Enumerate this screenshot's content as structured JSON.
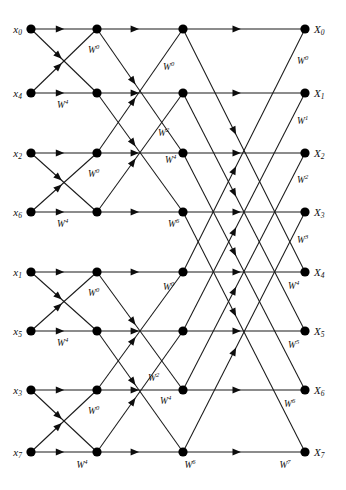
{
  "figure": {
    "type": "fft-butterfly-signal-flow-graph",
    "background_color": "#ffffff",
    "line_color": "#1a1a1a",
    "node_color": "#000000",
    "stages": 3,
    "points": 8
  },
  "geometry": {
    "width": 346,
    "height": 490,
    "column_x": [
      31,
      97,
      183,
      305
    ],
    "row_y": [
      29,
      93,
      153,
      212,
      272,
      331,
      390,
      452
    ],
    "node_radius": 4.6
  },
  "inputs": [
    {
      "symbol": "x",
      "index": "0",
      "row": 0
    },
    {
      "symbol": "x",
      "index": "4",
      "row": 1
    },
    {
      "symbol": "x",
      "index": "2",
      "row": 2
    },
    {
      "symbol": "x",
      "index": "6",
      "row": 3
    },
    {
      "symbol": "x",
      "index": "1",
      "row": 4
    },
    {
      "symbol": "x",
      "index": "5",
      "row": 5
    },
    {
      "symbol": "x",
      "index": "3",
      "row": 6
    },
    {
      "symbol": "x",
      "index": "7",
      "row": 7
    }
  ],
  "outputs": [
    {
      "symbol": "X",
      "index": "0",
      "row": 0
    },
    {
      "symbol": "X",
      "index": "1",
      "row": 1
    },
    {
      "symbol": "X",
      "index": "2",
      "row": 2
    },
    {
      "symbol": "X",
      "index": "3",
      "row": 3
    },
    {
      "symbol": "X",
      "index": "4",
      "row": 4
    },
    {
      "symbol": "X",
      "index": "5",
      "row": 5
    },
    {
      "symbol": "X",
      "index": "6",
      "row": 6
    },
    {
      "symbol": "X",
      "index": "7",
      "row": 7
    }
  ],
  "twiddle_labels": [
    {
      "stage": 1,
      "base": "W",
      "exponent": "0",
      "x": 88,
      "y": 53,
      "anchor": "start"
    },
    {
      "stage": 1,
      "base": "W",
      "exponent": "4",
      "x": 57,
      "y": 108,
      "anchor": "start"
    },
    {
      "stage": 1,
      "base": "W",
      "exponent": "0",
      "x": 88,
      "y": 177,
      "anchor": "start"
    },
    {
      "stage": 1,
      "base": "W",
      "exponent": "4",
      "x": 57,
      "y": 227,
      "anchor": "start"
    },
    {
      "stage": 1,
      "base": "W",
      "exponent": "0",
      "x": 88,
      "y": 296,
      "anchor": "start"
    },
    {
      "stage": 1,
      "base": "W",
      "exponent": "4",
      "x": 57,
      "y": 346,
      "anchor": "start"
    },
    {
      "stage": 1,
      "base": "W",
      "exponent": "0",
      "x": 88,
      "y": 414,
      "anchor": "start"
    },
    {
      "stage": 1,
      "base": "W",
      "exponent": "4",
      "x": 82,
      "y": 468,
      "anchor": "middle"
    },
    {
      "stage": 2,
      "base": "W",
      "exponent": "0",
      "x": 163,
      "y": 70,
      "anchor": "start"
    },
    {
      "stage": 2,
      "base": "W",
      "exponent": "2",
      "x": 158,
      "y": 136,
      "anchor": "start"
    },
    {
      "stage": 2,
      "base": "W",
      "exponent": "4",
      "x": 165,
      "y": 163,
      "anchor": "start"
    },
    {
      "stage": 2,
      "base": "W",
      "exponent": "6",
      "x": 168,
      "y": 227,
      "anchor": "start"
    },
    {
      "stage": 2,
      "base": "W",
      "exponent": "0",
      "x": 163,
      "y": 290,
      "anchor": "start"
    },
    {
      "stage": 2,
      "base": "W",
      "exponent": "2",
      "x": 148,
      "y": 381,
      "anchor": "start"
    },
    {
      "stage": 2,
      "base": "W",
      "exponent": "4",
      "x": 160,
      "y": 404,
      "anchor": "start"
    },
    {
      "stage": 2,
      "base": "W",
      "exponent": "6",
      "x": 190,
      "y": 468,
      "anchor": "middle"
    },
    {
      "stage": 3,
      "base": "W",
      "exponent": "0",
      "x": 297,
      "y": 64,
      "anchor": "start"
    },
    {
      "stage": 3,
      "base": "W",
      "exponent": "1",
      "x": 297,
      "y": 124,
      "anchor": "start"
    },
    {
      "stage": 3,
      "base": "W",
      "exponent": "2",
      "x": 297,
      "y": 183,
      "anchor": "start"
    },
    {
      "stage": 3,
      "base": "W",
      "exponent": "3",
      "x": 297,
      "y": 243,
      "anchor": "start"
    },
    {
      "stage": 3,
      "base": "W",
      "exponent": "4",
      "x": 288,
      "y": 289,
      "anchor": "start"
    },
    {
      "stage": 3,
      "base": "W",
      "exponent": "5",
      "x": 288,
      "y": 348,
      "anchor": "start"
    },
    {
      "stage": 3,
      "base": "W",
      "exponent": "6",
      "x": 284,
      "y": 407,
      "anchor": "start"
    },
    {
      "stage": 3,
      "base": "W",
      "exponent": "7",
      "x": 285,
      "y": 468,
      "anchor": "middle"
    }
  ],
  "edges": [
    {
      "stage": 1,
      "from_col": 0,
      "to_col": 1,
      "from_row": 0,
      "to_row": 0
    },
    {
      "stage": 1,
      "from_col": 0,
      "to_col": 1,
      "from_row": 0,
      "to_row": 1
    },
    {
      "stage": 1,
      "from_col": 0,
      "to_col": 1,
      "from_row": 1,
      "to_row": 0
    },
    {
      "stage": 1,
      "from_col": 0,
      "to_col": 1,
      "from_row": 1,
      "to_row": 1
    },
    {
      "stage": 1,
      "from_col": 0,
      "to_col": 1,
      "from_row": 2,
      "to_row": 2
    },
    {
      "stage": 1,
      "from_col": 0,
      "to_col": 1,
      "from_row": 2,
      "to_row": 3
    },
    {
      "stage": 1,
      "from_col": 0,
      "to_col": 1,
      "from_row": 3,
      "to_row": 2
    },
    {
      "stage": 1,
      "from_col": 0,
      "to_col": 1,
      "from_row": 3,
      "to_row": 3
    },
    {
      "stage": 1,
      "from_col": 0,
      "to_col": 1,
      "from_row": 4,
      "to_row": 4
    },
    {
      "stage": 1,
      "from_col": 0,
      "to_col": 1,
      "from_row": 4,
      "to_row": 5
    },
    {
      "stage": 1,
      "from_col": 0,
      "to_col": 1,
      "from_row": 5,
      "to_row": 4
    },
    {
      "stage": 1,
      "from_col": 0,
      "to_col": 1,
      "from_row": 5,
      "to_row": 5
    },
    {
      "stage": 1,
      "from_col": 0,
      "to_col": 1,
      "from_row": 6,
      "to_row": 6
    },
    {
      "stage": 1,
      "from_col": 0,
      "to_col": 1,
      "from_row": 6,
      "to_row": 7
    },
    {
      "stage": 1,
      "from_col": 0,
      "to_col": 1,
      "from_row": 7,
      "to_row": 6
    },
    {
      "stage": 1,
      "from_col": 0,
      "to_col": 1,
      "from_row": 7,
      "to_row": 7
    },
    {
      "stage": 2,
      "from_col": 1,
      "to_col": 2,
      "from_row": 0,
      "to_row": 0
    },
    {
      "stage": 2,
      "from_col": 1,
      "to_col": 2,
      "from_row": 0,
      "to_row": 2
    },
    {
      "stage": 2,
      "from_col": 1,
      "to_col": 2,
      "from_row": 1,
      "to_row": 1
    },
    {
      "stage": 2,
      "from_col": 1,
      "to_col": 2,
      "from_row": 1,
      "to_row": 3
    },
    {
      "stage": 2,
      "from_col": 1,
      "to_col": 2,
      "from_row": 2,
      "to_row": 0
    },
    {
      "stage": 2,
      "from_col": 1,
      "to_col": 2,
      "from_row": 2,
      "to_row": 2
    },
    {
      "stage": 2,
      "from_col": 1,
      "to_col": 2,
      "from_row": 3,
      "to_row": 1
    },
    {
      "stage": 2,
      "from_col": 1,
      "to_col": 2,
      "from_row": 3,
      "to_row": 3
    },
    {
      "stage": 2,
      "from_col": 1,
      "to_col": 2,
      "from_row": 4,
      "to_row": 4
    },
    {
      "stage": 2,
      "from_col": 1,
      "to_col": 2,
      "from_row": 4,
      "to_row": 6
    },
    {
      "stage": 2,
      "from_col": 1,
      "to_col": 2,
      "from_row": 5,
      "to_row": 5
    },
    {
      "stage": 2,
      "from_col": 1,
      "to_col": 2,
      "from_row": 5,
      "to_row": 7
    },
    {
      "stage": 2,
      "from_col": 1,
      "to_col": 2,
      "from_row": 6,
      "to_row": 4
    },
    {
      "stage": 2,
      "from_col": 1,
      "to_col": 2,
      "from_row": 6,
      "to_row": 6
    },
    {
      "stage": 2,
      "from_col": 1,
      "to_col": 2,
      "from_row": 7,
      "to_row": 5
    },
    {
      "stage": 2,
      "from_col": 1,
      "to_col": 2,
      "from_row": 7,
      "to_row": 7
    },
    {
      "stage": 3,
      "from_col": 2,
      "to_col": 3,
      "from_row": 0,
      "to_row": 0
    },
    {
      "stage": 3,
      "from_col": 2,
      "to_col": 3,
      "from_row": 0,
      "to_row": 4
    },
    {
      "stage": 3,
      "from_col": 2,
      "to_col": 3,
      "from_row": 1,
      "to_row": 1
    },
    {
      "stage": 3,
      "from_col": 2,
      "to_col": 3,
      "from_row": 1,
      "to_row": 5
    },
    {
      "stage": 3,
      "from_col": 2,
      "to_col": 3,
      "from_row": 2,
      "to_row": 2
    },
    {
      "stage": 3,
      "from_col": 2,
      "to_col": 3,
      "from_row": 2,
      "to_row": 6
    },
    {
      "stage": 3,
      "from_col": 2,
      "to_col": 3,
      "from_row": 3,
      "to_row": 3
    },
    {
      "stage": 3,
      "from_col": 2,
      "to_col": 3,
      "from_row": 3,
      "to_row": 7
    },
    {
      "stage": 3,
      "from_col": 2,
      "to_col": 3,
      "from_row": 4,
      "to_row": 0
    },
    {
      "stage": 3,
      "from_col": 2,
      "to_col": 3,
      "from_row": 4,
      "to_row": 4
    },
    {
      "stage": 3,
      "from_col": 2,
      "to_col": 3,
      "from_row": 5,
      "to_row": 1
    },
    {
      "stage": 3,
      "from_col": 2,
      "to_col": 3,
      "from_row": 5,
      "to_row": 5
    },
    {
      "stage": 3,
      "from_col": 2,
      "to_col": 3,
      "from_row": 6,
      "to_row": 2
    },
    {
      "stage": 3,
      "from_col": 2,
      "to_col": 3,
      "from_row": 6,
      "to_row": 6
    },
    {
      "stage": 3,
      "from_col": 2,
      "to_col": 3,
      "from_row": 7,
      "to_row": 3
    },
    {
      "stage": 3,
      "from_col": 2,
      "to_col": 3,
      "from_row": 7,
      "to_row": 7
    }
  ]
}
